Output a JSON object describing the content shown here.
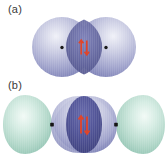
{
  "figure": {
    "background_color": "#ffffff",
    "width": 168,
    "height": 161
  },
  "panels": [
    {
      "id": "a",
      "label": "(a)",
      "description": "Two overlapping spherical s orbitals forming a sigma bond",
      "lobe_color": "#9a9dc8",
      "lobe_highlight_color": "#e4e5f2",
      "overlap_color": "#5b5e9e",
      "nucleus_color": "#1a1a1a",
      "nuclei_count": 2,
      "electrons": {
        "arrow_color": "#e0452a",
        "spins": [
          "up",
          "down"
        ],
        "count": 2
      }
    },
    {
      "id": "b",
      "label": "(b)",
      "description": "Two hybrid orbitals overlapping end-to-end with small back lobes",
      "front_lobe_color": "#9a9dc8",
      "front_lobe_highlight_color": "#e4e5f2",
      "back_lobe_color": "#a9d2c4",
      "back_lobe_highlight_color": "#eaf5f0",
      "overlap_color": "#4a4d93",
      "nucleus_color": "#1a1a1a",
      "nuclei_count": 2,
      "electrons": {
        "arrow_color": "#e0452a",
        "spins": [
          "up",
          "down"
        ],
        "count": 2
      }
    }
  ]
}
